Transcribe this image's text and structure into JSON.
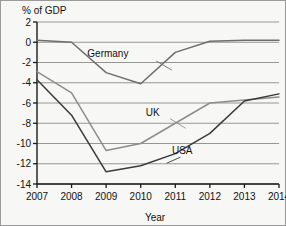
{
  "chart_data": {
    "type": "line",
    "title": "",
    "xlabel": "Year",
    "ylabel": "% of GDP",
    "ylabel_position": "top-left",
    "categories": [
      "2007",
      "2008",
      "2009",
      "2010",
      "2011",
      "2012",
      "2013",
      "2014"
    ],
    "x": [
      2007,
      2008,
      2009,
      2010,
      2011,
      2012,
      2013,
      2014
    ],
    "xlim": [
      2007,
      2014
    ],
    "ylim": [
      -14,
      2
    ],
    "ytick_labels": [
      "2",
      "0",
      "-2",
      "-4",
      "-6",
      "-8",
      "-10",
      "-12",
      "-14"
    ],
    "yticks": [
      2,
      0,
      -2,
      -4,
      -6,
      -8,
      -10,
      -12,
      -14
    ],
    "grid": "horizontal",
    "legend": "inline-labels-with-leader-lines",
    "series": [
      {
        "name": "Germany",
        "color": "#6e6e6e",
        "values": [
          0.2,
          0.0,
          -3.0,
          -4.1,
          -1.0,
          0.1,
          0.2,
          0.2
        ],
        "label": "Germany",
        "label_x": 2009.05,
        "label_y": -1.45,
        "leader_from_x": 2010.45,
        "leader_from_y": -1.85,
        "leader_to_x": 2010.9,
        "leader_to_y": -2.75
      },
      {
        "name": "UK",
        "color": "#8d8d8d",
        "values": [
          -2.9,
          -5.0,
          -10.7,
          -10.0,
          -8.0,
          -6.0,
          -5.7,
          -5.4
        ],
        "label": "UK",
        "label_x": 2010.35,
        "label_y": -7.25,
        "leader_from_x": 2010.85,
        "leader_from_y": -7.55,
        "leader_to_x": 2011.3,
        "leader_to_y": -8.5
      },
      {
        "name": "USA",
        "color": "#3a3a3a",
        "values": [
          -3.7,
          -7.2,
          -12.8,
          -12.2,
          -11.0,
          -9.0,
          -5.8,
          -5.1
        ],
        "label": "USA",
        "label_x": 2011.2,
        "label_y": -11.0,
        "leader_from_x": 2011.15,
        "leader_from_y": -11.35,
        "leader_to_x": 2010.75,
        "leader_to_y": -11.95
      }
    ],
    "colors": {
      "background": "#f7f7f5",
      "gridline": "#8a8a8a",
      "axis": "#1a1a1a",
      "border": "#9a9a9a",
      "germany": "#6e6e6e",
      "uk": "#8d8d8d",
      "usa": "#3a3a3a"
    }
  }
}
